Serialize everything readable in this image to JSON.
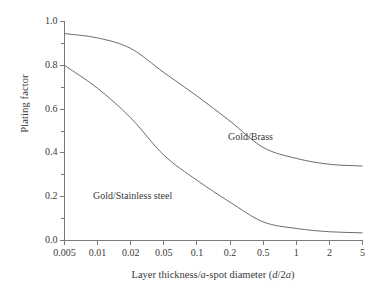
{
  "chart_data": {
    "type": "line",
    "title": "",
    "xlabel": "Layer thickness/a-spot diameter (d/2a)",
    "ylabel": "Plating factor",
    "xscale": "log",
    "xlim": [
      0.005,
      5
    ],
    "ylim": [
      0.0,
      1.0
    ],
    "grid": false,
    "legend_position": "inline-annotation",
    "xticks": [
      "0.005",
      "0.01",
      "0.02",
      "0.05",
      "0.1",
      "0.2",
      "0.5",
      "1",
      "2",
      "5"
    ],
    "xtick_values": [
      0.005,
      0.01,
      0.02,
      0.05,
      0.1,
      0.2,
      0.5,
      1,
      2,
      5
    ],
    "yticks": [
      "0.0",
      "0.2",
      "0.4",
      "0.6",
      "0.8",
      "1.0"
    ],
    "ytick_values": [
      0.0,
      0.2,
      0.4,
      0.6,
      0.8,
      1.0
    ],
    "yminor_ticks": [
      0.1,
      0.3,
      0.5,
      0.7,
      0.9
    ],
    "series": [
      {
        "name": "Gold/Brass",
        "color": "#6d6d6d",
        "x": [
          0.005,
          0.01,
          0.02,
          0.05,
          0.1,
          0.2,
          0.5,
          1,
          2,
          5
        ],
        "values": [
          0.945,
          0.925,
          0.877,
          0.767,
          0.66,
          0.545,
          0.425,
          0.375,
          0.348,
          0.34
        ],
        "label_text": "Gold/Brass"
      },
      {
        "name": "Gold/Stainless steel",
        "color": "#6d6d6d",
        "x": [
          0.005,
          0.01,
          0.02,
          0.05,
          0.1,
          0.2,
          0.5,
          1,
          2,
          5
        ],
        "values": [
          0.8,
          0.695,
          0.56,
          0.39,
          0.275,
          0.175,
          0.085,
          0.055,
          0.04,
          0.035
        ],
        "label_text": "Gold/Stainless steel"
      }
    ],
    "annotations": [
      {
        "text": "Gold/Brass",
        "x_px": 228,
        "y_px": 131
      },
      {
        "text": "Gold/Stainless steel",
        "x_px": 93,
        "y_px": 190
      }
    ]
  },
  "axes": {
    "xlabel_prefix": "Layer thickness/",
    "xlabel_a": "a",
    "xlabel_mid": "-spot diameter (",
    "xlabel_d": "d",
    "xlabel_slash2": "/2",
    "xlabel_a2": "a",
    "xlabel_suffix": ")",
    "ylabel_text": "Plating factor"
  },
  "colors": {
    "curve": "#6d6d6d",
    "axis": "#7a7a7a",
    "text": "#3a3a3a",
    "background": "#ffffff"
  }
}
